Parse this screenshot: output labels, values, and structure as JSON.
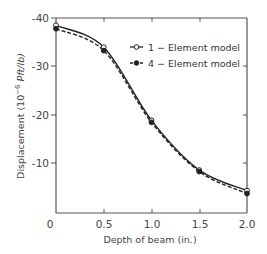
{
  "chart_data": {
    "type": "line",
    "title": "",
    "xlabel": "Depth of beam (in.)",
    "ylabel": "Displacement (10⁻⁶ Pft/lb)",
    "xlim": [
      0,
      2.0
    ],
    "ylim": [
      0,
      -40
    ],
    "x_ticks": [
      "0",
      "0.5",
      "1.0",
      "1.5",
      "2.0"
    ],
    "y_ticks": [
      "-40",
      "-30",
      "-20",
      "-10"
    ],
    "grid": false,
    "legend_position": "upper right",
    "x": [
      0,
      0.5,
      1.0,
      1.5,
      2.0
    ],
    "series": [
      {
        "name": "1 − Element model",
        "marker": "open-circle",
        "line": "solid",
        "values": [
          -38.5,
          -34.0,
          -19.0,
          -8.8,
          -4.6
        ]
      },
      {
        "name": "4 − Element model",
        "marker": "filled-circle",
        "line": "dashed",
        "values": [
          -37.8,
          -33.3,
          -18.6,
          -8.5,
          -4.0
        ]
      }
    ]
  },
  "labels": {
    "x_axis": "Depth of beam (in.)",
    "y_axis_prefix": "Displacement (10",
    "y_axis_exp": "−6",
    "y_axis_suffix": " Pft/lb)",
    "legend_1": "1 − Element model",
    "legend_4": "4 − Element model",
    "xt0": "0",
    "xt1": "0.5",
    "xt2": "1.0",
    "xt3": "1.5",
    "xt4": "2.0",
    "yt40": "-40",
    "yt30": "-30",
    "yt20": "-20",
    "yt10": "-10"
  }
}
